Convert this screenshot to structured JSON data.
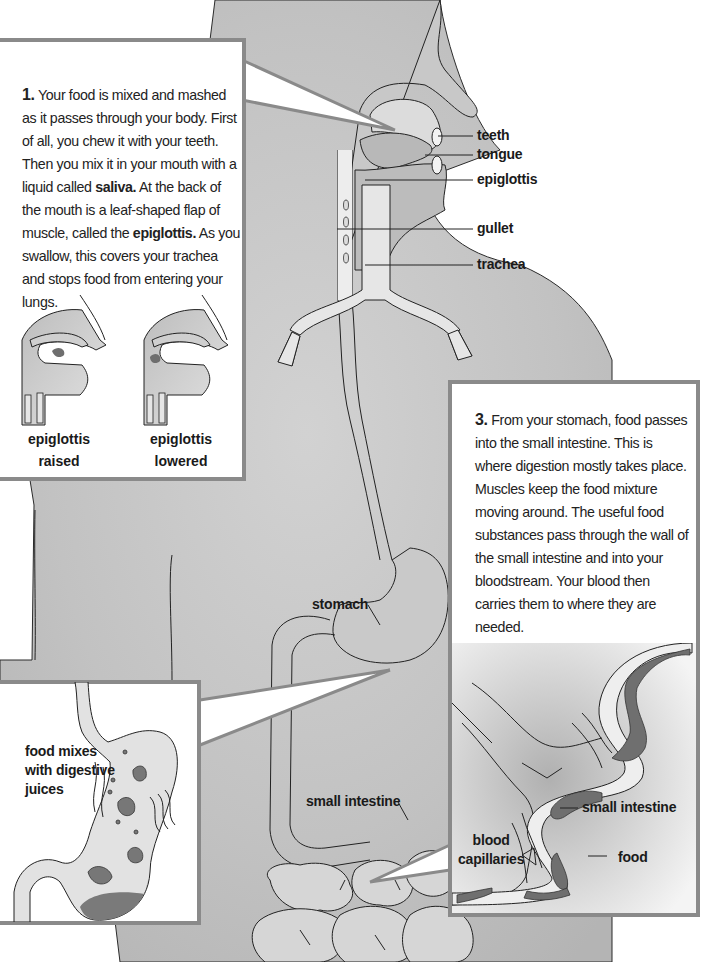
{
  "panel1": {
    "number": "1.",
    "text_parts": {
      "p1": "Your food is mixed and mashed as it passes through your body. First of all, you chew it with your teeth. Then you mix it in your mouth with a liquid called ",
      "saliva": "saliva.",
      "p2": " At the back of the mouth is a leaf-shaped flap of muscle, called the ",
      "epiglottis": "epiglottis.",
      "p3": " As you swallow, this covers your trachea and stops food from entering your lungs."
    },
    "captions": {
      "raised_1": "epiglottis",
      "raised_2": "raised",
      "lowered_1": "epiglottis",
      "lowered_2": "lowered"
    }
  },
  "head_labels": {
    "teeth": "teeth",
    "tongue": "tongue",
    "epiglottis": "epiglottis",
    "gullet": "gullet",
    "trachea": "trachea"
  },
  "body_labels": {
    "stomach": "stomach",
    "small_intestine": "small intestine"
  },
  "panel2": {
    "label_1": "food mixes",
    "label_2": "with digestive",
    "label_3": "juices"
  },
  "panel3": {
    "number": "3.",
    "text": "From your stomach, food passes into the small intestine. This is where digestion mostly takes place. Muscles keep the food mixture moving around. The useful food substances pass through the wall of the small intestine and into your bloodstream. Your blood then carries them to where they are needed.",
    "labels": {
      "small_intestine": "small intestine",
      "blood_1": "blood",
      "blood_2": "capillaries",
      "food": "food"
    }
  },
  "colors": {
    "body_gray": "#c4c4c4",
    "organ_light": "#e2e2e2",
    "panel_border": "#8a8a8a",
    "food_dark": "#6e6e6e"
  }
}
